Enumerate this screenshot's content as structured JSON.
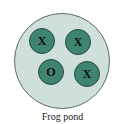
{
  "diagram": {
    "label": "Frog pond",
    "colors": {
      "pond": "#cfe0dc",
      "frog": "#3f8470",
      "outline": "#23483e"
    },
    "frogs": [
      {
        "mark": "X",
        "cx": 42,
        "cy": 41
      },
      {
        "mark": "X",
        "cx": 78,
        "cy": 42
      },
      {
        "mark": "O",
        "cx": 51,
        "cy": 72
      },
      {
        "mark": "X",
        "cx": 87,
        "cy": 74
      }
    ]
  }
}
